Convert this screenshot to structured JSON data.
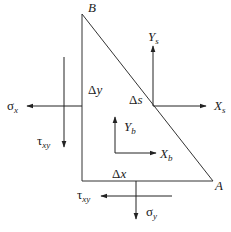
{
  "diagram": {
    "type": "free-body triangular element",
    "vertices": {
      "B": {
        "label": "B"
      },
      "A": {
        "label": "A"
      }
    },
    "edges": {
      "vertical": {
        "label": "Δy"
      },
      "bottom": {
        "label": "Δx"
      },
      "hypotenuse": {
        "label": "Δs"
      }
    },
    "stresses": {
      "sigma_x": {
        "base": "σ",
        "sub": "x"
      },
      "tau_xy_left": {
        "base": "τ",
        "sub": "xy"
      },
      "tau_xy_bottom": {
        "base": "τ",
        "sub": "xy"
      },
      "sigma_y": {
        "base": "σ",
        "sub": "y"
      }
    },
    "surface_forces": {
      "Xs": {
        "base": "X",
        "sub": "s"
      },
      "Ys": {
        "base": "Y",
        "sub": "s"
      }
    },
    "body_forces": {
      "Xb": {
        "base": "X",
        "sub": "b"
      },
      "Yb": {
        "base": "Y",
        "sub": "b"
      }
    },
    "line_color": "#333333"
  }
}
